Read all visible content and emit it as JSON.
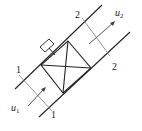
{
  "diagram": {
    "type": "pipe-with-device",
    "colors": {
      "pipe": "#222222",
      "section": "#888888",
      "arrow": "#444444",
      "background": "#ffffff"
    },
    "sections": [
      {
        "id": "1",
        "label_top": "1",
        "label_bottom": "1"
      },
      {
        "id": "2",
        "label_top": "2",
        "label_bottom": "2"
      }
    ],
    "velocities": [
      {
        "symbol": "u",
        "subscript": "1"
      },
      {
        "symbol": "u",
        "subscript": "2"
      }
    ]
  }
}
